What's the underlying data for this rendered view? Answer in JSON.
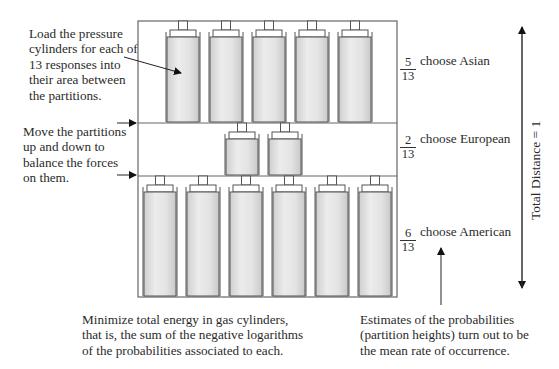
{
  "diagram": {
    "total_responses": 13,
    "compartments": [
      {
        "id": "asian",
        "numerator": "5",
        "denominator": "13",
        "label": "choose Asian",
        "cylinders": 5
      },
      {
        "id": "european",
        "numerator": "2",
        "denominator": "13",
        "label": "choose European",
        "cylinders": 2
      },
      {
        "id": "american",
        "numerator": "6",
        "denominator": "13",
        "label": "choose American",
        "cylinders": 6
      }
    ],
    "axis_label": "Total Distance = 1",
    "annotations": {
      "load": "Load the pressure\ncylinders for each of\n13 responses into\ntheir area between\nthe partitions.",
      "move": "Move the partitions\nup and down to\nbalance the forces\non them.",
      "minimize": "Minimize total energy in gas cylinders,\nthat is, the sum of the negative logarithms\nof the probabilities associated to each.",
      "estimates": "Estimates of the probabilities\n(partition heights) turn out to be\nthe mean rate of occurrence."
    },
    "colors": {
      "line": "#555555",
      "cylinder_fill_light": "#eeeeee",
      "cylinder_fill_dark": "#cfcfcf",
      "text": "#2a2a2a"
    }
  }
}
